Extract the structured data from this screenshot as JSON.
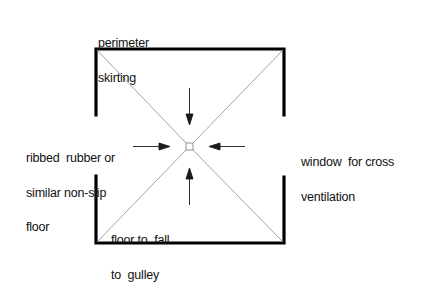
{
  "diagram": {
    "type": "floor plan detail",
    "labels": {
      "perimeter": [
        "perimeter",
        "skirting"
      ],
      "floor_material": [
        "ribbed  rubber or",
        "similar non-slip",
        "floor"
      ],
      "window": [
        "window  for cross",
        "ventilation"
      ],
      "fall": [
        "floor to  fall",
        "to  gulley"
      ]
    },
    "colors": {
      "wall": "#000000",
      "diagonal": "#9a9a9a",
      "arrow": "#1a1a1a",
      "text": "#111111"
    }
  }
}
